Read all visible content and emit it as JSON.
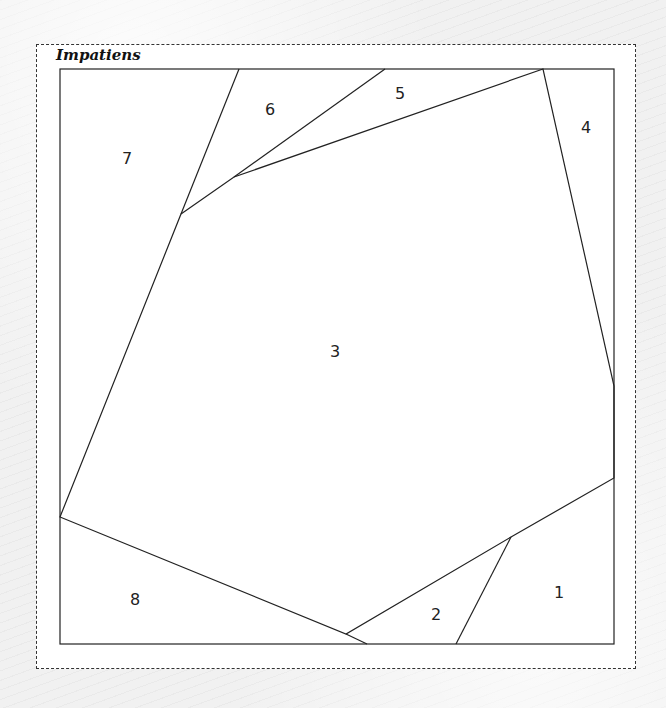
{
  "title": "Impatiens",
  "pieces": [
    {
      "id": "1",
      "label": "1",
      "x": 559,
      "y": 592
    },
    {
      "id": "2",
      "label": "2",
      "x": 436,
      "y": 614
    },
    {
      "id": "3",
      "label": "3",
      "x": 335,
      "y": 351
    },
    {
      "id": "4",
      "label": "4",
      "x": 586,
      "y": 127
    },
    {
      "id": "5",
      "label": "5",
      "x": 400,
      "y": 93
    },
    {
      "id": "6",
      "label": "6",
      "x": 270,
      "y": 109
    },
    {
      "id": "7",
      "label": "7",
      "x": 127,
      "y": 158
    },
    {
      "id": "8",
      "label": "8",
      "x": 135,
      "y": 599
    }
  ],
  "colors": {
    "line": "#222222",
    "fill": "#ffffff",
    "frame": "#333333"
  }
}
